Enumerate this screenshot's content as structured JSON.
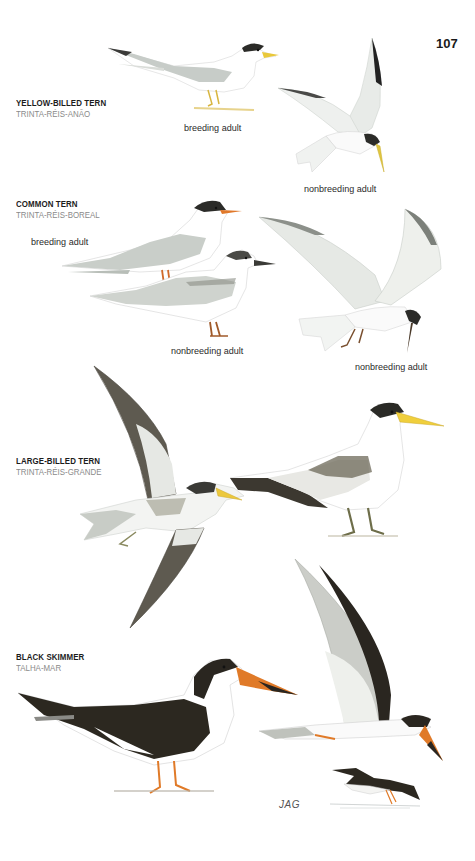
{
  "page": {
    "number": "107",
    "artist_signature": "JAG"
  },
  "species": [
    {
      "name": "YELLOW-BILLED TERN",
      "local_name": "TRINTA-RÉIS-ANÃO",
      "captions": [
        "breeding adult",
        "nonbreeding adult"
      ]
    },
    {
      "name": "COMMON TERN",
      "local_name": "TRINTA-RÉIS-BOREAL",
      "captions": [
        "breeding adult",
        "nonbreeding adult",
        "nonbreeding adult"
      ]
    },
    {
      "name": "LARGE-BILLED TERN",
      "local_name": "TRINTA-RÉIS-GRANDE",
      "captions": []
    },
    {
      "name": "BLACK SKIMMER",
      "local_name": "TALHA-MAR",
      "captions": []
    }
  ],
  "colors": {
    "heading": "#1c1c1c",
    "local_name": "#8a8a8a",
    "caption": "#2a2a2a",
    "tern_grey": "#c9cec9",
    "cap_black": "#2b2b28",
    "bill_yellow": "#e9c83a",
    "bill_orange": "#e0782a",
    "skimmer_black": "#2c2820",
    "large_tern_bill": "#f0cf3c"
  }
}
